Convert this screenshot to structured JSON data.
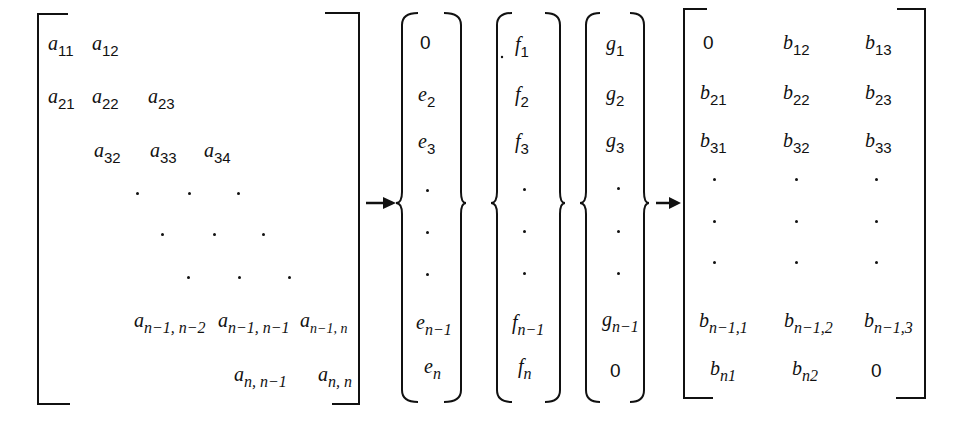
{
  "matrix_a": {
    "rows": [
      [
        {
          "v": "a",
          "sub": "11"
        },
        {
          "v": "a",
          "sub": "12"
        }
      ],
      [
        {
          "v": "a",
          "sub": "21"
        },
        {
          "v": "a",
          "sub": "22"
        },
        {
          "v": "a",
          "sub": "23"
        }
      ],
      [
        {
          "v": "a",
          "sub": "32"
        },
        {
          "v": "a",
          "sub": "33"
        },
        {
          "v": "a",
          "sub": "34"
        }
      ],
      [
        "·",
        "·",
        "·"
      ],
      [
        "·",
        "·",
        "·"
      ],
      [
        "·",
        "·",
        "·"
      ],
      [
        {
          "v": "a",
          "sub": "n−1, n−2"
        },
        {
          "v": "a",
          "sub": "n−1, n−1"
        },
        {
          "v": "a",
          "sub": "n−1, n"
        }
      ],
      [
        {
          "v": "a",
          "sub": "n, n−1"
        },
        {
          "v": "a",
          "sub": "n, n"
        }
      ]
    ],
    "labels": {
      "a11": "11",
      "a12": "12",
      "a21": "21",
      "a22": "22",
      "a23": "23",
      "a32": "32",
      "a33": "33",
      "a34": "34",
      "an1n2_1": "n−1, n−2",
      "an1n1": "n−1, n−1",
      "an1n": "n−1, n",
      "ann1": "n, n−1",
      "ann": "n, n"
    }
  },
  "vector_e": {
    "first": "0",
    "e2": "2",
    "e3": "3",
    "en1": "n−1",
    "en": "n"
  },
  "vector_f": {
    "f1": "1",
    "f2": "2",
    "f3": "3",
    "fn1": "n−1",
    "fn": "n"
  },
  "vector_g": {
    "g1": "1",
    "g2": "2",
    "g3": "3",
    "gn1": "n−1",
    "last": "0"
  },
  "matrix_b": {
    "b11": "0",
    "b12": "12",
    "b13": "13",
    "b21": "21",
    "b22": "22",
    "b23": "23",
    "b31": "31",
    "b32": "32",
    "b33": "33",
    "bn11": "n−1,1",
    "bn12": "n−1,2",
    "bn13": "n−1,3",
    "bn1": "n1",
    "bn2": "n2",
    "bn3": "0"
  },
  "symbols": {
    "a": "a",
    "b": "b",
    "e": "e",
    "f": "f",
    "g": "g"
  },
  "arrows": [
    "matrix-to-vectors",
    "vectors-to-compact-matrix"
  ]
}
